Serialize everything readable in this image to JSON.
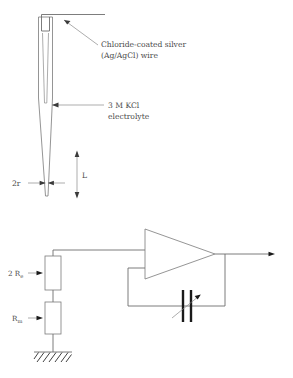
{
  "figure": {
    "background_color": "#ffffff",
    "line_color": "#7a7a7a",
    "text_color": "#4a4a4a"
  },
  "electrode_diagram": {
    "labels": {
      "wire_line1": "Chloride-coated silver",
      "wire_line2": "(Ag/AgCl) wire",
      "electrolyte_line1": "3 M KCl",
      "electrolyte_line2": "electrolyte",
      "tip_diameter": "2r",
      "tip_length": "L"
    }
  },
  "circuit_diagram": {
    "labels": {
      "resistor_electrode_prefix": "2 R",
      "resistor_electrode_sub": "e",
      "resistor_membrane_prefix": "R",
      "resistor_membrane_sub": "m"
    },
    "components": {
      "amplifier": "operational-amplifier",
      "feedback": "variable-capacitor",
      "reference": "ground"
    }
  }
}
